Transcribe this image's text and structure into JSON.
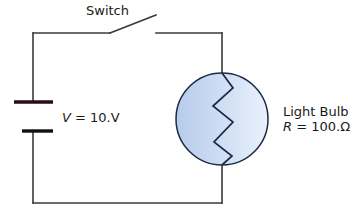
{
  "diagram": {
    "background_color": "#ffffff",
    "wire_color": "#3a3a3a",
    "labels": {
      "switch": "Switch",
      "voltage_symbol": "V",
      "voltage_equation": " = 10.V",
      "voltage_full": "V = 10.V",
      "bulb_name": "Light Bulb",
      "resistance_symbol": "R",
      "resistance_equation": " = 100.Ω",
      "resistance_full": "R = 100.Ω"
    },
    "components": {
      "battery": {
        "name": "battery",
        "positive_plate_color": "#2b0b16",
        "negative_plate_color": "#111111",
        "voltage_value": "10.",
        "voltage_unit": "V"
      },
      "switch": {
        "name": "switch",
        "state": "open"
      },
      "light_bulb": {
        "name": "light-bulb",
        "fill_gradient_from": "#b9cdec",
        "fill_gradient_to": "#e8f0fb",
        "outline_color": "#1b2a44",
        "filament_color": "#1b2a44",
        "resistance_value": "100.",
        "resistance_unit": "Ω"
      }
    }
  }
}
